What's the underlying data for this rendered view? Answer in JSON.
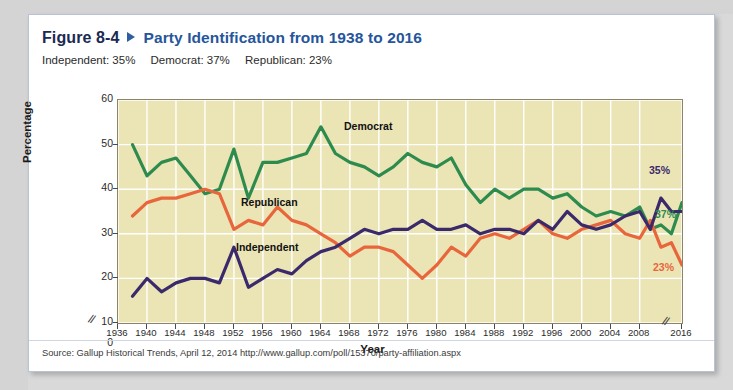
{
  "figure": {
    "number": "Figure 8-4",
    "title": "Party Identification from 1938 to 2016",
    "subtitle_independent": "Independent: 35%",
    "subtitle_democrat": "Democrat: 37%",
    "subtitle_republican": "Republican: 23%",
    "source": "Source: Gallup Historical Trends, April 12, 2014 http://www.gallup.com/poll/15370/party-affiliation.aspx",
    "title_color": "#25559b",
    "number_color": "#1b2a52"
  },
  "chart_data": {
    "type": "line",
    "title": "Party Identification from 1938 to 2016",
    "xlabel": "Year",
    "ylabel": "Percentage",
    "xlim": [
      1936,
      2016
    ],
    "ylim": [
      10,
      60
    ],
    "y_axis_break_below": 10,
    "x_axis_break_between": [
      2008,
      2016
    ],
    "grid": true,
    "grid_color": "#ffffff",
    "plot_background": "#ebe4b5",
    "legend_position": "inline-annotations",
    "yticks": [
      0,
      10,
      20,
      30,
      40,
      50,
      60
    ],
    "xticks": [
      1936,
      1940,
      1944,
      1948,
      1952,
      1956,
      1960,
      1964,
      1968,
      1972,
      1976,
      1980,
      1984,
      1988,
      1992,
      1996,
      2000,
      2004,
      2008,
      2016
    ],
    "annotations": [
      {
        "text": "Democrat",
        "series": "Democrat"
      },
      {
        "text": "Republican",
        "series": "Republican"
      },
      {
        "text": "Independent",
        "series": "Independent"
      },
      {
        "text": "35%",
        "series": "Independent",
        "color": "#3b2a6b"
      },
      {
        "text": "37%",
        "series": "Democrat",
        "color": "#2e8b4e"
      },
      {
        "text": "23%",
        "series": "Republican",
        "color": "#e8663c"
      }
    ],
    "series": [
      {
        "name": "Democrat",
        "color": "#2e8b4e",
        "end_value": 37,
        "x": [
          1938,
          1940,
          1942,
          1944,
          1946,
          1948,
          1950,
          1952,
          1954,
          1956,
          1958,
          1960,
          1962,
          1964,
          1966,
          1968,
          1970,
          1972,
          1974,
          1976,
          1978,
          1980,
          1982,
          1984,
          1986,
          1988,
          1990,
          1992,
          1994,
          1996,
          1998,
          2000,
          2002,
          2004,
          2006,
          2008,
          2010,
          2012,
          2014,
          2016
        ],
        "values": [
          50,
          43,
          46,
          47,
          43,
          39,
          40,
          49,
          38,
          46,
          46,
          47,
          48,
          54,
          48,
          46,
          45,
          43,
          45,
          48,
          46,
          45,
          47,
          41,
          37,
          40,
          38,
          40,
          40,
          38,
          39,
          36,
          34,
          35,
          34,
          36,
          31,
          32,
          30,
          37
        ]
      },
      {
        "name": "Republican",
        "color": "#e8663c",
        "end_value": 23,
        "x": [
          1938,
          1940,
          1942,
          1944,
          1946,
          1948,
          1950,
          1952,
          1954,
          1956,
          1958,
          1960,
          1962,
          1964,
          1966,
          1968,
          1970,
          1972,
          1974,
          1976,
          1978,
          1980,
          1982,
          1984,
          1986,
          1988,
          1990,
          1992,
          1994,
          1996,
          1998,
          2000,
          2002,
          2004,
          2006,
          2008,
          2010,
          2012,
          2014,
          2016
        ],
        "values": [
          34,
          37,
          38,
          38,
          39,
          40,
          39,
          31,
          33,
          32,
          36,
          33,
          32,
          30,
          28,
          25,
          27,
          27,
          26,
          23,
          20,
          23,
          27,
          25,
          29,
          30,
          29,
          31,
          33,
          30,
          29,
          31,
          32,
          33,
          30,
          29,
          33,
          27,
          28,
          23
        ]
      },
      {
        "name": "Independent",
        "color": "#3b2a6b",
        "end_value": 35,
        "x": [
          1938,
          1940,
          1942,
          1944,
          1946,
          1948,
          1950,
          1952,
          1954,
          1956,
          1958,
          1960,
          1962,
          1964,
          1966,
          1968,
          1970,
          1972,
          1974,
          1976,
          1978,
          1980,
          1982,
          1984,
          1986,
          1988,
          1990,
          1992,
          1994,
          1996,
          1998,
          2000,
          2002,
          2004,
          2006,
          2008,
          2010,
          2012,
          2014,
          2016
        ],
        "values": [
          16,
          20,
          17,
          19,
          20,
          20,
          19,
          27,
          18,
          20,
          22,
          21,
          24,
          26,
          27,
          29,
          31,
          30,
          31,
          31,
          33,
          31,
          31,
          32,
          30,
          31,
          31,
          30,
          33,
          31,
          35,
          32,
          31,
          32,
          34,
          35,
          31,
          38,
          35,
          35
        ]
      }
    ]
  }
}
